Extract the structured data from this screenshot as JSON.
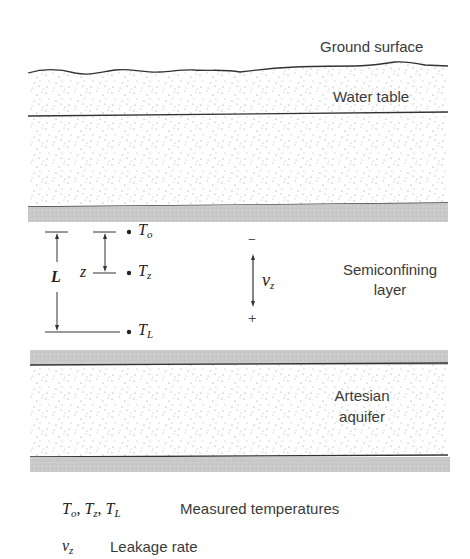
{
  "diagram": {
    "layers": [
      {
        "name": "Ground surface",
        "kind": "surface-line"
      },
      {
        "name": "Unsaturated zone",
        "kind": "sand"
      },
      {
        "name": "Water table",
        "kind": "line"
      },
      {
        "name": "Unconfined aquifer",
        "kind": "sand"
      },
      {
        "name": "Semiconfining layer",
        "kind": "clay",
        "label_line1": "Semiconfining",
        "label_line2": "layer"
      },
      {
        "name": "Artesian aquifer",
        "kind": "sand",
        "label_line1": "Artesian",
        "label_line2": "aquifer"
      }
    ],
    "labels": {
      "ground_surface": "Ground surface",
      "water_table": "Water table",
      "semiconfining_1": "Semiconfining",
      "semiconfining_2": "layer",
      "artesian_1": "Artesian",
      "artesian_2": "aquifer"
    },
    "measurement": {
      "T_o": {
        "base": "T",
        "sub": "o"
      },
      "T_z": {
        "base": "T",
        "sub": "z"
      },
      "T_L": {
        "base": "T",
        "sub": "L"
      },
      "L_label": "L",
      "z_label": "z",
      "v_base": "v",
      "v_sub": "z",
      "minus": "−",
      "plus": "+"
    },
    "colors": {
      "clay_gray": "#c8c8c8",
      "line": "#333333",
      "dot": "#999999"
    }
  },
  "legend": [
    {
      "symbol": "T_o, T_z, T_L",
      "symbol_parts": [
        {
          "base": "T",
          "sub": "o"
        },
        {
          "base": "T",
          "sub": "z"
        },
        {
          "base": "T",
          "sub": "L"
        }
      ],
      "description": "Measured temperatures"
    },
    {
      "symbol": "v_z",
      "symbol_parts": [
        {
          "base": "v",
          "sub": "z"
        }
      ],
      "description": "Leakage rate"
    }
  ]
}
